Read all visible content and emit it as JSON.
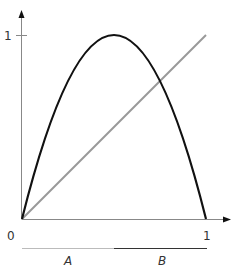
{
  "diagram": {
    "type": "function-plot",
    "axes": {
      "origin_label": "0",
      "x_tick_label": "1",
      "y_tick_label": "1"
    },
    "curves": [
      {
        "name": "parabola",
        "description": "hump curve f(x)=4x(1-x)",
        "color": "#111111"
      },
      {
        "name": "diagonal",
        "description": "identity line y=x",
        "color": "#999999"
      }
    ],
    "intervals": [
      {
        "label": "A",
        "color": "#bbbbbb"
      },
      {
        "label": "B",
        "color": "#333333"
      }
    ]
  }
}
